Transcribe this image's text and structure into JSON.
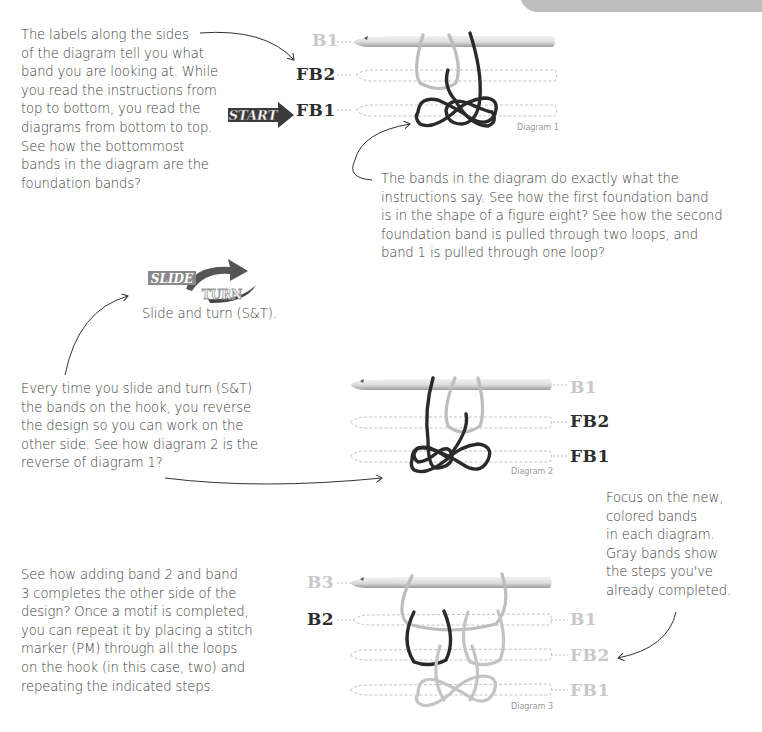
{
  "page": {
    "corner_tab": ""
  },
  "annotations": {
    "labels_note": [
      "The labels along the sides",
      "of the diagram tell you what",
      "band you are looking at. While",
      "you read the instructions from",
      "top to bottom, you read the",
      "diagrams from bottom to top.",
      "See how the bottommost",
      "bands in the diagram are the",
      "foundation bands?"
    ],
    "bands_note": [
      "The bands in the diagram do exactly what the",
      "instructions say. See how the first foundation band",
      "is in the shape of a figure eight? See how the second",
      "foundation band is pulled through two loops, and",
      "band 1 is pulled through one loop?"
    ],
    "slide_caption": "Slide and turn (S&T).",
    "slide_note": [
      "Every time you slide and turn (S&T)",
      "the bands on the hook, you reverse",
      "the design so you can work on the",
      "other side. See how diagram 2 is the",
      "reverse of diagram 1?"
    ],
    "focus_note": [
      "Focus on the new,",
      "colored bands",
      "in each diagram.",
      "Gray bands show",
      "the steps you've",
      "already completed."
    ],
    "motif_note": [
      "See how adding band 2 and band",
      "3 completes the other side of the",
      "design? Once a motif is completed,",
      "you can repeat it by placing a stitch",
      "marker (PM) through all the loops",
      "on the hook (in this case, two) and",
      "repeating the indicated steps."
    ]
  },
  "badges": {
    "start": "START",
    "slide_word": "SLIDE",
    "amp": "&",
    "turn_word": "TURN"
  },
  "diagrams": [
    {
      "caption": "Diagram 1",
      "labels": [
        {
          "text": "B1",
          "tone": "light"
        },
        {
          "text": "FB2",
          "tone": "dark"
        },
        {
          "text": "FB1",
          "tone": "dark"
        }
      ]
    },
    {
      "caption": "Diagram 2",
      "labels": [
        {
          "text": "B1",
          "tone": "light"
        },
        {
          "text": "FB2",
          "tone": "dark"
        },
        {
          "text": "FB1",
          "tone": "dark"
        }
      ]
    },
    {
      "caption": "Diagram 3",
      "labels_left": [
        {
          "text": "B3",
          "tone": "light"
        },
        {
          "text": "B2",
          "tone": "dark"
        }
      ],
      "labels_right": [
        {
          "text": "B1",
          "tone": "light"
        },
        {
          "text": "FB2",
          "tone": "light"
        },
        {
          "text": "FB1",
          "tone": "light"
        }
      ]
    }
  ],
  "colors": {
    "band_dark": "#2a2a2a",
    "band_light": "#bdbdbd",
    "hook": "#d9d9d9",
    "text": "#3d3d3d",
    "label_light": "#c8c8c8",
    "tab": "#bdbdbd"
  }
}
